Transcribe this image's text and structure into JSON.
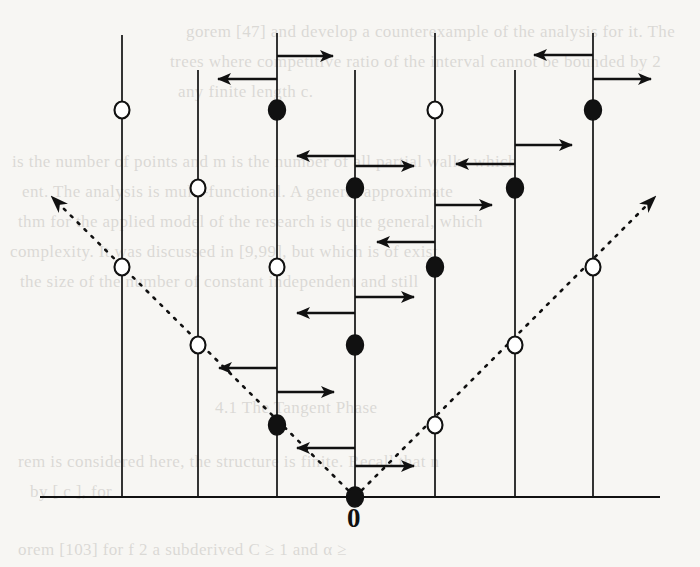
{
  "figure": {
    "name": "lattice-path-diagram",
    "origin_label": "0",
    "colors": {
      "ink": "#111111",
      "paper": "#f7f6f3",
      "open_fill": "#ffffff",
      "filled_fill": "#111111",
      "bleed_text": "#4b4640"
    },
    "axis": {
      "y": 497,
      "x_start": 40,
      "x_end": 660,
      "stroke_width": 2.2
    },
    "vertical_lines": [
      {
        "id": "line-1",
        "x": 122,
        "y_top": 35,
        "y_bottom": 497
      },
      {
        "id": "line-2",
        "x": 198,
        "y_top": 70,
        "y_bottom": 497
      },
      {
        "id": "line-3",
        "x": 277,
        "y_top": 33,
        "y_bottom": 497
      },
      {
        "id": "line-4",
        "x": 355,
        "y_top": 70,
        "y_bottom": 497
      },
      {
        "id": "line-5",
        "x": 435,
        "y_top": 33,
        "y_bottom": 497
      },
      {
        "id": "line-6",
        "x": 515,
        "y_top": 70,
        "y_bottom": 497
      },
      {
        "id": "line-7",
        "x": 593,
        "y_top": 33,
        "y_bottom": 497
      }
    ],
    "nodes": [
      {
        "id": "node-l1-a",
        "x": 122,
        "y": 110,
        "type": "open"
      },
      {
        "id": "node-l1-b",
        "x": 122,
        "y": 267,
        "type": "open"
      },
      {
        "id": "node-l2-a",
        "x": 198,
        "y": 188,
        "type": "open"
      },
      {
        "id": "node-l2-b",
        "x": 198,
        "y": 345,
        "type": "open"
      },
      {
        "id": "node-l3-a",
        "x": 277,
        "y": 110,
        "type": "filled"
      },
      {
        "id": "node-l3-b",
        "x": 277,
        "y": 267,
        "type": "open"
      },
      {
        "id": "node-l3-c",
        "x": 277,
        "y": 425,
        "type": "filled"
      },
      {
        "id": "node-l4-a",
        "x": 355,
        "y": 188,
        "type": "filled"
      },
      {
        "id": "node-l4-b",
        "x": 355,
        "y": 345,
        "type": "filled"
      },
      {
        "id": "node-l4-c",
        "x": 355,
        "y": 497,
        "type": "filled"
      },
      {
        "id": "node-l5-a",
        "x": 435,
        "y": 110,
        "type": "open"
      },
      {
        "id": "node-l5-b",
        "x": 435,
        "y": 267,
        "type": "filled"
      },
      {
        "id": "node-l5-c",
        "x": 435,
        "y": 425,
        "type": "open"
      },
      {
        "id": "node-l6-a",
        "x": 515,
        "y": 188,
        "type": "filled"
      },
      {
        "id": "node-l6-b",
        "x": 515,
        "y": 345,
        "type": "open"
      },
      {
        "id": "node-l7-a",
        "x": 593,
        "y": 110,
        "type": "filled"
      },
      {
        "id": "node-l7-b",
        "x": 593,
        "y": 267,
        "type": "open"
      }
    ],
    "arrows": [
      {
        "id": "arrow-1",
        "x1": 277,
        "y1": 56,
        "x2": 333,
        "y2": 56,
        "dir": "right"
      },
      {
        "id": "arrow-2",
        "x1": 277,
        "y1": 79,
        "x2": 218,
        "y2": 79,
        "dir": "left"
      },
      {
        "id": "arrow-3",
        "x1": 593,
        "y1": 55,
        "x2": 534,
        "y2": 55,
        "dir": "left"
      },
      {
        "id": "arrow-4",
        "x1": 593,
        "y1": 79,
        "x2": 651,
        "y2": 79,
        "dir": "right"
      },
      {
        "id": "arrow-5",
        "x1": 355,
        "y1": 156,
        "x2": 297,
        "y2": 156,
        "dir": "left"
      },
      {
        "id": "arrow-6",
        "x1": 355,
        "y1": 166,
        "x2": 414,
        "y2": 166,
        "dir": "right"
      },
      {
        "id": "arrow-7",
        "x1": 515,
        "y1": 145,
        "x2": 572,
        "y2": 145,
        "dir": "right"
      },
      {
        "id": "arrow-8",
        "x1": 515,
        "y1": 164,
        "x2": 456,
        "y2": 164,
        "dir": "left"
      },
      {
        "id": "arrow-9",
        "x1": 435,
        "y1": 205,
        "x2": 492,
        "y2": 205,
        "dir": "right"
      },
      {
        "id": "arrow-10",
        "x1": 435,
        "y1": 242,
        "x2": 377,
        "y2": 242,
        "dir": "left"
      },
      {
        "id": "arrow-11",
        "x1": 355,
        "y1": 297,
        "x2": 414,
        "y2": 297,
        "dir": "right"
      },
      {
        "id": "arrow-12",
        "x1": 355,
        "y1": 313,
        "x2": 297,
        "y2": 313,
        "dir": "left"
      },
      {
        "id": "arrow-13",
        "x1": 277,
        "y1": 368,
        "x2": 219,
        "y2": 368,
        "dir": "left"
      },
      {
        "id": "arrow-14",
        "x1": 277,
        "y1": 392,
        "x2": 334,
        "y2": 392,
        "dir": "right"
      },
      {
        "id": "arrow-15",
        "x1": 355,
        "y1": 448,
        "x2": 297,
        "y2": 448,
        "dir": "left"
      },
      {
        "id": "arrow-16",
        "x1": 355,
        "y1": 466,
        "x2": 414,
        "y2": 466,
        "dir": "right"
      }
    ],
    "dashed_rays": [
      {
        "id": "dashed-ray-left",
        "x1": 355,
        "y1": 497,
        "x2": 52,
        "y2": 197,
        "arrowhead": "start-to-end"
      },
      {
        "id": "dashed-ray-right",
        "x1": 355,
        "y1": 497,
        "x2": 655,
        "y2": 197,
        "arrowhead": "start-to-end"
      }
    ],
    "bleed_text_lines": [
      {
        "id": "bleed-1",
        "x": 186,
        "y": 22,
        "text": "gorem [47] and develop a counterexample of the analysis for it. The"
      },
      {
        "id": "bleed-2",
        "x": 170,
        "y": 52,
        "text": "trees where competitive ratio of the interval cannot be bounded by 2"
      },
      {
        "id": "bleed-3",
        "x": 178,
        "y": 82,
        "text": "any finite length c."
      },
      {
        "id": "bleed-4",
        "x": 12,
        "y": 152,
        "text": "is the number of points and m is the number of all partial walks which"
      },
      {
        "id": "bleed-5",
        "x": 22,
        "y": 182,
        "text": "ent. The analysis is multi-functional.  A general approximate"
      },
      {
        "id": "bleed-6",
        "x": 18,
        "y": 212,
        "text": "thm for the applied model of the research is quite general, which"
      },
      {
        "id": "bleed-7",
        "x": 10,
        "y": 242,
        "text": "complexity. It was discussed in [9,99], but which is of exist"
      },
      {
        "id": "bleed-8",
        "x": 20,
        "y": 272,
        "text": "the size of the number of constant independent and still"
      },
      {
        "id": "bleed-9",
        "x": 215,
        "y": 398,
        "text": "4.1  The  Tangent Phase"
      },
      {
        "id": "bleed-10",
        "x": 18,
        "y": 452,
        "text": "rem  is considered here, the structure is finite. Recall that   n"
      },
      {
        "id": "bleed-11",
        "x": 30,
        "y": 482,
        "text": "by  [ c ],  for"
      },
      {
        "id": "bleed-12",
        "x": 18,
        "y": 540,
        "text": "orem [103]  for f  2  a  subderived  C  ≥  1  and  α  ≥"
      }
    ]
  }
}
